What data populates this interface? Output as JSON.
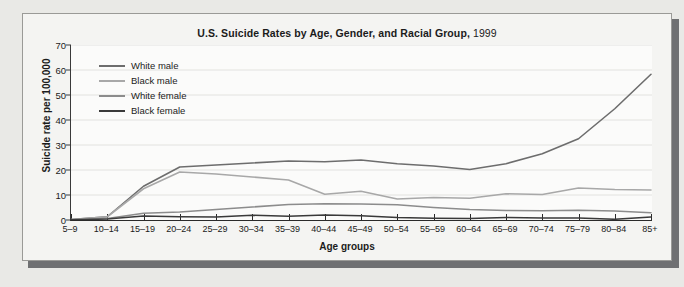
{
  "panel": {
    "title_main": "U.S. Suicide Rates by Age, Gender, and Racial Group,",
    "title_year": "1999"
  },
  "axes": {
    "y_title": "Suicide rate per 100,000",
    "x_title": "Age groups",
    "y_ticks": [
      "0",
      "10",
      "20",
      "30",
      "40",
      "50",
      "60",
      "70"
    ]
  },
  "legend": {
    "items": [
      {
        "label": "White male",
        "color": "#6d6d6d"
      },
      {
        "label": "Black male",
        "color": "#a8a8a8"
      },
      {
        "label": "White female",
        "color": "#8c8c8c"
      },
      {
        "label": "Black female",
        "color": "#3a3a3a"
      }
    ]
  },
  "colors": {
    "panel_background": "#f4f4f2",
    "plot_background": "#fbfbfa",
    "page_background": "#e9e9e6",
    "gridline": "#e2e2df",
    "axis": "#2a2a2a",
    "shadow": "#6f7072"
  },
  "chart_data": {
    "type": "line",
    "title": "U.S. Suicide Rates by Age, Gender, and Racial Group, 1999",
    "xlabel": "Age groups",
    "ylabel": "Suicide rate per 100,000",
    "ylim": [
      0,
      70
    ],
    "yticks": [
      0,
      10,
      20,
      30,
      40,
      50,
      60,
      70
    ],
    "grid": true,
    "legend_position": "upper-left inside plot",
    "categories": [
      "5–9",
      "10–14",
      "15–19",
      "20–24",
      "25–29",
      "30–34",
      "35–39",
      "40–44",
      "45–49",
      "50–54",
      "55–59",
      "60–64",
      "65–69",
      "70–74",
      "75–79",
      "80–84",
      "85+"
    ],
    "series": [
      {
        "name": "White male",
        "color": "#6d6d6d",
        "values": [
          0.2,
          1.3,
          13.5,
          21.2,
          22.0,
          22.8,
          23.6,
          23.3,
          24.0,
          22.5,
          21.6,
          20.2,
          22.5,
          26.5,
          32.5,
          44.5,
          58.3
        ]
      },
      {
        "name": "Black male",
        "color": "#a8a8a8",
        "values": [
          0.2,
          1.3,
          12.5,
          19.2,
          18.4,
          17.2,
          16.0,
          10.3,
          11.5,
          8.4,
          9.0,
          8.7,
          10.5,
          10.2,
          12.8,
          12.2,
          12.0
        ]
      },
      {
        "name": "White female",
        "color": "#8c8c8c",
        "values": [
          0.1,
          0.6,
          2.7,
          3.2,
          4.2,
          5.2,
          6.2,
          6.5,
          6.4,
          6.1,
          5.0,
          4.2,
          3.8,
          3.7,
          3.9,
          3.6,
          2.9
        ]
      },
      {
        "name": "Black female",
        "color": "#3a3a3a",
        "values": [
          0.1,
          0.4,
          1.6,
          1.3,
          1.2,
          1.9,
          1.5,
          2.0,
          1.7,
          1.0,
          0.7,
          0.6,
          1.0,
          0.8,
          0.8,
          0.3,
          1.2
        ]
      }
    ]
  }
}
